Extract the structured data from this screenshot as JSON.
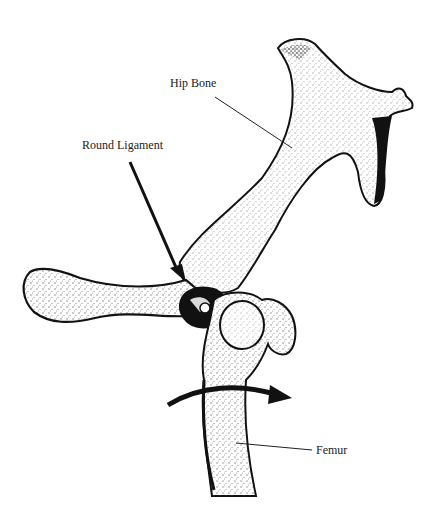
{
  "figure": {
    "labels": {
      "hip_bone": "Hip Bone",
      "round_ligament": "Round Ligament",
      "femur": "Femur"
    },
    "colors": {
      "ink": "#111111",
      "stipple": "#333333",
      "background": "#ffffff"
    }
  }
}
